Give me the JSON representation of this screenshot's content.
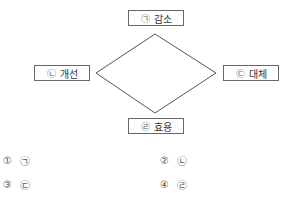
{
  "diagram": {
    "type": "diamond",
    "nodes": [
      {
        "id": "top",
        "marker": "㉠",
        "label": "감소"
      },
      {
        "id": "left",
        "marker": "㉡",
        "label": "개선"
      },
      {
        "id": "right",
        "marker": "㉢",
        "label": "대체"
      },
      {
        "id": "bottom",
        "marker": "㉣",
        "label": "효용"
      }
    ]
  },
  "options": [
    {
      "num": "①",
      "answer": "㉠"
    },
    {
      "num": "②",
      "answer": "㉡"
    },
    {
      "num": "③",
      "answer": "㉢"
    },
    {
      "num": "④",
      "answer": "㉣"
    }
  ]
}
